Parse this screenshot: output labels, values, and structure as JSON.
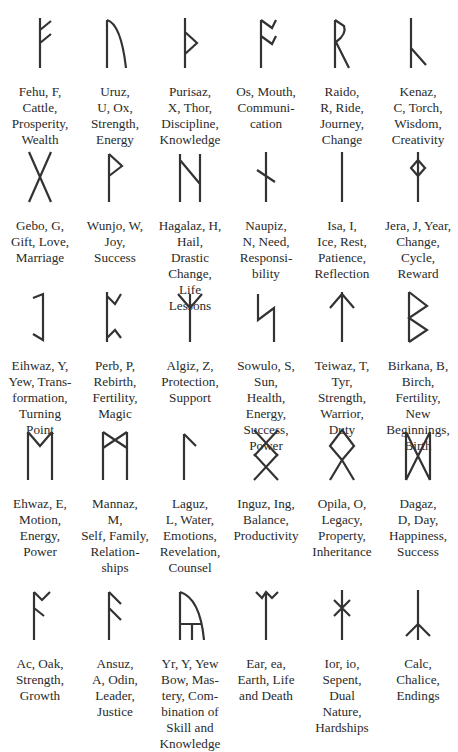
{
  "runes": [
    {
      "icon": "fehu-rune-icon",
      "label": "Fehu, F,\nCattle,\nProsperity,\nWealth"
    },
    {
      "icon": "uruz-rune-icon",
      "label": "Uruz,\nU, Ox,\nStrength,\nEnergy"
    },
    {
      "icon": "purisaz-rune-icon",
      "label": "Purisaz,\nX, Thor,\nDiscipline,\nKnowledge"
    },
    {
      "icon": "os-rune-icon",
      "label": "Os, Mouth,\nCommuni-\ncation"
    },
    {
      "icon": "raido-rune-icon",
      "label": "Raido,\nR, Ride,\nJourney,\nChange"
    },
    {
      "icon": "kenaz-rune-icon",
      "label": "Kenaz,\nC, Torch,\nWisdom,\nCreativity"
    },
    {
      "icon": "gebo-rune-icon",
      "label": "Gebo, G,\nGift, Love,\nMarriage"
    },
    {
      "icon": "wunjo-rune-icon",
      "label": "Wunjo, W,\nJoy,\nSuccess"
    },
    {
      "icon": "hagalaz-rune-icon",
      "label": "Hagalaz, H,\nHail,\nDrastic\nChange,\nLife\nLessons"
    },
    {
      "icon": "naupiz-rune-icon",
      "label": "Naupiz,\nN, Need,\nResponsi-\nbility"
    },
    {
      "icon": "isa-rune-icon",
      "label": "Isa, I,\nIce, Rest,\nPatience,\nReflection"
    },
    {
      "icon": "jera-rune-icon",
      "label": "Jera, J, Year,\nChange,\nCycle,\nReward"
    },
    {
      "icon": "eihwaz-rune-icon",
      "label": "Eihwaz, Y,\nYew, Trans-\nformation,\nTurning\nPoint"
    },
    {
      "icon": "perb-rune-icon",
      "label": "Perb, P,\nRebirth,\nFertility,\nMagic"
    },
    {
      "icon": "algiz-rune-icon",
      "label": "Algiz, Z,\nProtection,\nSupport"
    },
    {
      "icon": "sowulo-rune-icon",
      "label": "Sowulo, S,\nSun,\nHealth,\nEnergy,\nSuccess,\nPower"
    },
    {
      "icon": "teiwaz-rune-icon",
      "label": "Teiwaz, T,\nTyr,\nStrength,\nWarrior,\nDuty"
    },
    {
      "icon": "birkana-rune-icon",
      "label": "Birkana, B,\nBirch,\nFertility,\nNew\nBeginnings,\nBirth"
    },
    {
      "icon": "ehwaz-rune-icon",
      "label": "Ehwaz, E,\nMotion,\nEnergy,\nPower"
    },
    {
      "icon": "mannaz-rune-icon",
      "label": "Mannaz,\nM,\nSelf, Family,\nRelation-\nships"
    },
    {
      "icon": "laguz-rune-icon",
      "label": "Laguz,\nL, Water,\nEmotions,\nRevelation,\nCounsel"
    },
    {
      "icon": "inguz-rune-icon",
      "label": "Inguz, Ing,\nBalance,\nProductivity"
    },
    {
      "icon": "opila-rune-icon",
      "label": "Opila, O,\nLegacy,\nProperty,\nInheritance"
    },
    {
      "icon": "dagaz-rune-icon",
      "label": "Dagaz,\nD, Day,\nHappiness,\nSuccess"
    },
    {
      "icon": "ac-rune-icon",
      "label": "Ac, Oak,\nStrength,\nGrowth"
    },
    {
      "icon": "ansuz-rune-icon",
      "label": "Ansuz,\nA, Odin,\nLeader,\nJustice"
    },
    {
      "icon": "yr-rune-icon",
      "label": "Yr, Y, Yew\nBow, Mas-\ntery, Com-\nbination of\nSkill and\nKnowledge"
    },
    {
      "icon": "ear-rune-icon",
      "label": "Ear, ea,\nEarth, Life\nand Death"
    },
    {
      "icon": "ior-rune-icon",
      "label": "Ior, io,\nSepent,\nDual\nNature,\nHardships"
    },
    {
      "icon": "calc-rune-icon",
      "label": "Calc,\nChalice,\nEndings"
    }
  ]
}
